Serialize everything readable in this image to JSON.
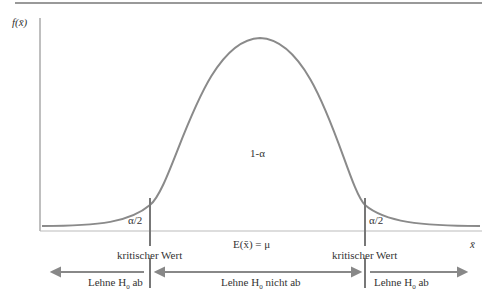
{
  "diagram": {
    "y_axis_label": "f(x̄)",
    "x_axis_label": "x̄",
    "center_region_label": "1-α",
    "tail_label_left": "α/2",
    "tail_label_right": "α/2",
    "mean_label": "E(x̄) = μ",
    "critical_value_left": "kritischer Wert",
    "critical_value_right": "kritischer Wert",
    "regions": [
      {
        "label_prefix": "Lehne H",
        "subscript": "0",
        "label_suffix": " ab"
      },
      {
        "label_prefix": "Lehne H",
        "subscript": "0",
        "label_suffix": " nicht ab"
      },
      {
        "label_prefix": "Lehne H",
        "subscript": "0",
        "label_suffix": " ab"
      }
    ],
    "colors": {
      "curve": "#8a8a8a",
      "lines": "#8a8a8a",
      "text": "#333333"
    }
  }
}
